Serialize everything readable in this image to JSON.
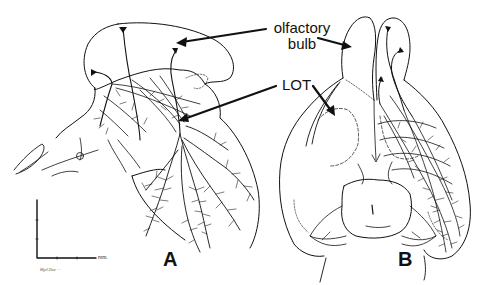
{
  "figure": {
    "labels": {
      "olfactory_bulb_line1": "olfactory",
      "olfactory_bulb_line2": "bulb",
      "lot": "LOT",
      "panel_a": "A",
      "panel_b": "B"
    },
    "scale_bar": {
      "unit": "mm."
    },
    "signature": "Myrl Dav ···",
    "colors": {
      "ink": "#111111",
      "background": "#ffffff"
    }
  }
}
